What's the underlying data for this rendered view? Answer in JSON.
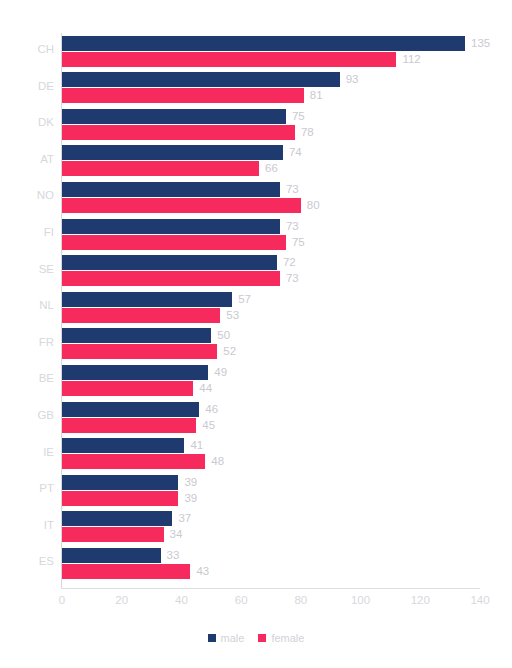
{
  "chart_data": {
    "type": "bar",
    "title": "",
    "subtitle": "",
    "xlabel": "",
    "ylabel": "",
    "orientation": "horizontal",
    "grid": false,
    "legend_position": "bottom-center",
    "xlim": [
      0,
      140
    ],
    "xticks": [
      0,
      20,
      40,
      60,
      80,
      100,
      120,
      140
    ],
    "xtick_labels": [
      "0",
      "20",
      "40",
      "60",
      "80",
      "100",
      "120",
      "140"
    ],
    "categories": [
      "CH",
      "DE",
      "DK",
      "AT",
      "NO",
      "FI",
      "SE",
      "NL",
      "FR",
      "BE",
      "GB",
      "IE",
      "PT",
      "IT",
      "ES"
    ],
    "series": [
      {
        "name": "male",
        "color": "#1f3a6e",
        "values": [
          135,
          93,
          75,
          74,
          73,
          73,
          72,
          57,
          50,
          49,
          46,
          41,
          39,
          37,
          33
        ]
      },
      {
        "name": "female",
        "color": "#f72a5e",
        "values": [
          112,
          81,
          78,
          66,
          80,
          75,
          73,
          53,
          52,
          44,
          45,
          48,
          39,
          34,
          43
        ]
      }
    ]
  },
  "legend": {
    "items": [
      {
        "label": "male",
        "color": "#1f3a6e"
      },
      {
        "label": "female",
        "color": "#f72a5e"
      }
    ]
  },
  "colors": {
    "male": "#1f3a6e",
    "female": "#f72a5e",
    "label_text": "#d7d7dc",
    "value_text": "#c9c9d0",
    "axis": "#dedee2",
    "background": "#ffffff"
  }
}
